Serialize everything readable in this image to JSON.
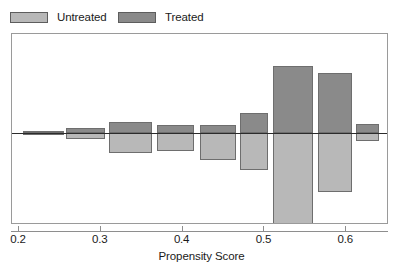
{
  "legend": {
    "position": "top-left",
    "entries": [
      {
        "label": "Untreated",
        "color": "#b8b8b8",
        "swatch_name": "legend-swatch-untreated"
      },
      {
        "label": "Treated",
        "color": "#8a8a8a",
        "swatch_name": "legend-swatch-treated"
      }
    ]
  },
  "axis": {
    "x_title": "Propensity Score",
    "x_ticks": [
      "0.2",
      "0.3",
      "0.4",
      "0.5",
      "0.6"
    ],
    "x_tick_values": [
      0.2,
      0.3,
      0.4,
      0.5,
      0.6
    ]
  },
  "chart_data": {
    "type": "bar",
    "subtype": "back-to-back mirrored histogram",
    "title": "",
    "subtitle": "",
    "xlabel": "Propensity Score",
    "ylabel": "",
    "grid": false,
    "legend_position": "top-left",
    "xlim": [
      0.188,
      0.648
    ],
    "ylim": [
      -0.48,
      0.52
    ],
    "zero_line": true,
    "series": [
      {
        "name": "Treated",
        "color": "#8a8a8a",
        "direction": "up",
        "values": [
          0.005,
          0.025,
          0.055,
          0.04,
          0.04,
          0.1,
          0.335,
          0.3,
          0.045
        ]
      },
      {
        "name": "Untreated",
        "color": "#b8b8b8",
        "direction": "down",
        "values": [
          0.005,
          0.03,
          0.1,
          0.09,
          0.135,
          0.185,
          0.47,
          0.295,
          0.04
        ]
      }
    ],
    "bins": [
      {
        "x_start": 0.205,
        "x_end": 0.255,
        "treated": 0.005,
        "untreated": 0.005
      },
      {
        "x_start": 0.258,
        "x_end": 0.305,
        "treated": 0.025,
        "untreated": 0.03
      },
      {
        "x_start": 0.31,
        "x_end": 0.362,
        "treated": 0.055,
        "untreated": 0.1
      },
      {
        "x_start": 0.369,
        "x_end": 0.414,
        "treated": 0.04,
        "untreated": 0.09
      },
      {
        "x_start": 0.421,
        "x_end": 0.465,
        "treated": 0.04,
        "untreated": 0.135
      },
      {
        "x_start": 0.47,
        "x_end": 0.504,
        "treated": 0.1,
        "untreated": 0.185
      },
      {
        "x_start": 0.51,
        "x_end": 0.56,
        "treated": 0.335,
        "untreated": 0.47
      },
      {
        "x_start": 0.565,
        "x_end": 0.607,
        "treated": 0.3,
        "untreated": 0.295
      },
      {
        "x_start": 0.612,
        "x_end": 0.64,
        "treated": 0.045,
        "untreated": 0.04
      }
    ]
  },
  "geometry": {
    "frame": {
      "left": 11,
      "top": 33,
      "width": 377,
      "height": 191
    },
    "zero_y_in_frame": 99,
    "x_px_at_0_2": 18,
    "px_per_0_1": 81.8,
    "px_per_unit_y": 200
  }
}
